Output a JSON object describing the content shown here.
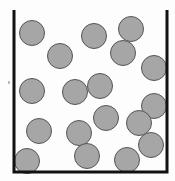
{
  "diagram": {
    "title": "",
    "container": {
      "left": 14,
      "right": 167,
      "top": 10,
      "bottom": 172,
      "stroke": "#111111",
      "stroke_width": 3
    },
    "particle_style": {
      "radius": 12.5,
      "fill": "#a6a6a6",
      "stroke": "#555555"
    },
    "particles": [
      {
        "x": 32,
        "y": 33
      },
      {
        "x": 94,
        "y": 36
      },
      {
        "x": 131,
        "y": 29
      },
      {
        "x": 60,
        "y": 56
      },
      {
        "x": 123,
        "y": 53
      },
      {
        "x": 154,
        "y": 68
      },
      {
        "x": 32,
        "y": 91
      },
      {
        "x": 75,
        "y": 92
      },
      {
        "x": 100,
        "y": 86
      },
      {
        "x": 154,
        "y": 106
      },
      {
        "x": 106,
        "y": 118
      },
      {
        "x": 39,
        "y": 131
      },
      {
        "x": 79,
        "y": 133
      },
      {
        "x": 139,
        "y": 123
      },
      {
        "x": 151,
        "y": 145
      },
      {
        "x": 87,
        "y": 156
      },
      {
        "x": 127,
        "y": 160
      },
      {
        "x": 27,
        "y": 161
      }
    ],
    "particle_count": 18,
    "side_mark": {
      "x": 8,
      "y": 81,
      "color": "#bbbbbb"
    }
  }
}
